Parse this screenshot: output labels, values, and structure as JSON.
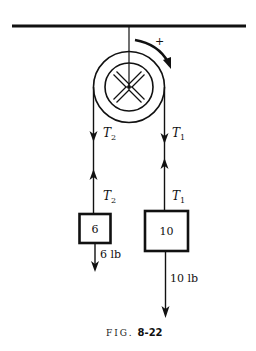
{
  "figure": {
    "caption_prefix": "FIG.",
    "caption_number": "8-22"
  },
  "pulley": {
    "rotation_sign": "+"
  },
  "ropes": {
    "left_upper_tension": {
      "symbol": "T",
      "subscript": "2"
    },
    "left_lower_tension": {
      "symbol": "T",
      "subscript": "2"
    },
    "right_upper_tension": {
      "symbol": "T",
      "subscript": "1"
    },
    "right_lower_tension": {
      "symbol": "T",
      "subscript": "1"
    }
  },
  "masses": {
    "left": {
      "label": "6",
      "weight_label": "6 lb"
    },
    "right": {
      "label": "10",
      "weight_label": "10 lb"
    }
  },
  "colors": {
    "ink": "#111111",
    "background": "#ffffff"
  }
}
